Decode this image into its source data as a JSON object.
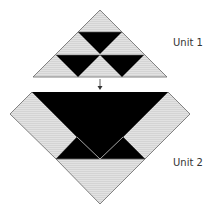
{
  "labels": {
    "unit1": "Unit 1",
    "unit2": "Unit 2"
  },
  "colors": {
    "light": "#dcdcdc",
    "dark": "#000000",
    "stroke": "#666666",
    "text": "#333333"
  },
  "icons": {
    "arrow": "down-arrow"
  }
}
